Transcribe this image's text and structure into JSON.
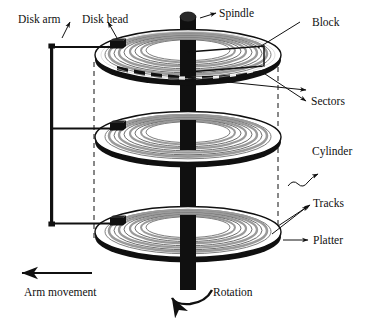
{
  "figure": {
    "background_color": "#ffffff",
    "ink_color": "#101010",
    "width": 369,
    "height": 319
  },
  "labels": {
    "disk_arm": "Disk arm",
    "disk_head": "Disk head",
    "spindle": "Spindle",
    "block": "Block",
    "sectors": "Sectors",
    "cylinder": "Cylinder",
    "tracks": "Tracks",
    "platter": "Platter",
    "arm_movement": "Arm movement",
    "rotation": "Rotation"
  },
  "components": {
    "platters": [
      {
        "name": "top-platter",
        "center_y": 55
      },
      {
        "name": "middle-platter",
        "center_y": 137
      },
      {
        "name": "bottom-platter",
        "center_y": 232
      }
    ],
    "spindle": {
      "name": "spindle-shaft",
      "color": "#000000"
    },
    "disk_arm": {
      "name": "actuator-arm",
      "arm_count": 3
    },
    "sector_marks": 12,
    "track_rings_per_platter": 4
  }
}
